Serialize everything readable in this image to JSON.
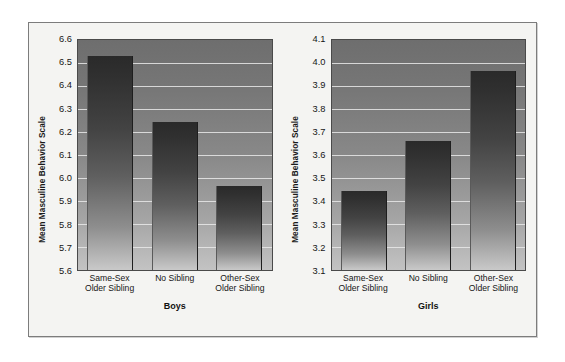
{
  "chart_data": [
    {
      "type": "bar",
      "title": "Boys",
      "xlabel": "",
      "ylabel": "Mean Masculine Behavior Scale",
      "categories": [
        "Same-Sex Older Sibling",
        "No Sibling",
        "Other-Sex Older Sibling"
      ],
      "category_lines": [
        [
          "Same-Sex",
          "Older Sibling"
        ],
        [
          "No Sibling",
          ""
        ],
        [
          "Other-Sex",
          "Older Sibling"
        ]
      ],
      "values": [
        6.53,
        6.245,
        5.965
      ],
      "ylim": [
        5.6,
        6.6
      ],
      "ytick_step": 0.1,
      "yticks": [
        "6.6",
        "6.5",
        "6.4",
        "6.3",
        "6.2",
        "6.1",
        "6.0",
        "5.9",
        "5.8",
        "5.7",
        "5.6"
      ],
      "ytick_values": [
        6.6,
        6.5,
        6.4,
        6.3,
        6.2,
        6.1,
        6.0,
        5.9,
        5.8,
        5.7,
        5.6
      ],
      "grid": true,
      "legend": "none"
    },
    {
      "type": "bar",
      "title": "Girls",
      "xlabel": "",
      "ylabel": "Mean Masculine Behavior Scale",
      "categories": [
        "Same-Sex Older Sibling",
        "No Sibling",
        "Other-Sex Older Sibling"
      ],
      "category_lines": [
        [
          "Same-Sex",
          "Older Sibling"
        ],
        [
          "No Sibling",
          ""
        ],
        [
          "Other-Sex",
          "Older Sibling"
        ]
      ],
      "values": [
        3.445,
        3.66,
        3.965
      ],
      "ylim": [
        3.1,
        4.1
      ],
      "ytick_step": 0.1,
      "yticks": [
        "4.1",
        "4.0",
        "3.9",
        "3.8",
        "3.7",
        "3.6",
        "3.5",
        "3.4",
        "3.3",
        "3.2",
        "3.1"
      ],
      "ytick_values": [
        4.1,
        4.0,
        3.9,
        3.8,
        3.7,
        3.6,
        3.5,
        3.4,
        3.3,
        3.2,
        3.1
      ],
      "grid": true,
      "legend": "none"
    }
  ],
  "colors": {
    "figure_background": "#f4f4f2",
    "figure_border": "#7c7c7c",
    "plot_top": "#6e6e6e",
    "plot_bottom": "#c3c3c3",
    "bar_top": "#2a2a2a",
    "bar_bottom": "#c9c9c9",
    "gridline": "#e9e9e9",
    "text": "#161616"
  }
}
